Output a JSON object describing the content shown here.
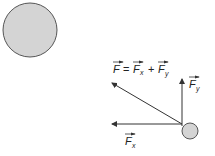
{
  "diagram": {
    "large_ball": {
      "fill": "#d4d4d4",
      "stroke": "#555555"
    },
    "small_ball": {
      "fill": "#d4d4d4",
      "stroke": "#555555"
    },
    "equation": {
      "F": "F",
      "eq": "=",
      "Fx": "F",
      "x": "x",
      "plus": "+",
      "Fy": "F",
      "y": "y"
    },
    "label_fy": {
      "F": "F",
      "sub": "y"
    },
    "label_fx": {
      "F": "F",
      "sub": "x"
    }
  }
}
